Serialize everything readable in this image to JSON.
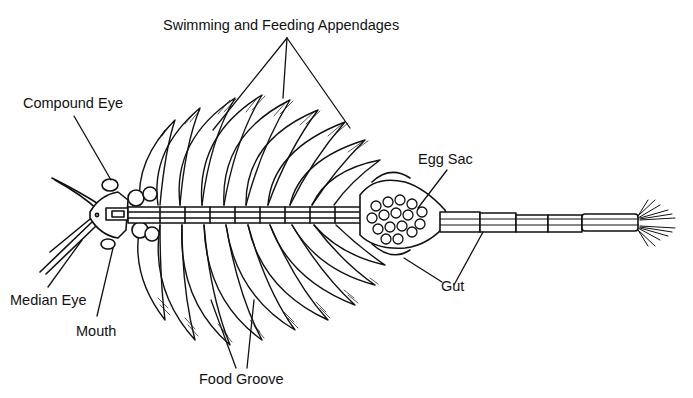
{
  "diagram": {
    "labels": {
      "appendages": "Swimming and Feeding Appendages",
      "compound_eye": "Compound Eye",
      "median_eye": "Median Eye",
      "mouth": "Mouth",
      "food_groove": "Food Groove",
      "egg_sac": "Egg Sac",
      "gut": "Gut"
    },
    "colors": {
      "ink": "#111111",
      "background": "#ffffff"
    }
  }
}
